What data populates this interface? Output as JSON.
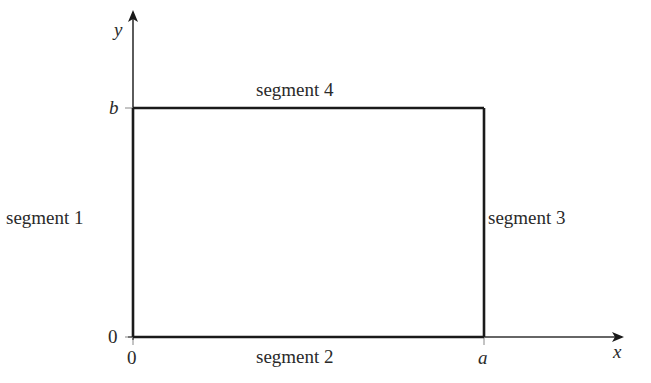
{
  "diagram": {
    "type": "rectangle-boundary",
    "axes": {
      "x_label": "x",
      "y_label": "y"
    },
    "ticks": {
      "x_origin": "0",
      "x_end": "a",
      "y_origin": "0",
      "y_end": "b"
    },
    "segments": [
      {
        "id": 1,
        "label": "segment 1",
        "side": "left"
      },
      {
        "id": 2,
        "label": "segment 2",
        "side": "bottom"
      },
      {
        "id": 3,
        "label": "segment 3",
        "side": "right"
      },
      {
        "id": 4,
        "label": "segment 4",
        "side": "top"
      }
    ],
    "colors": {
      "line": "#1a1a1a",
      "axis": "#333333",
      "text": "#2a2a2a"
    }
  }
}
